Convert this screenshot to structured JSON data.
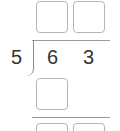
{
  "problem": {
    "type": "long-division",
    "divisor": "5",
    "dividend_digits": [
      "6",
      "3"
    ]
  },
  "quotient_boxes": [
    {
      "value": ""
    },
    {
      "value": ""
    }
  ],
  "step1_boxes": [
    {
      "value": ""
    }
  ],
  "step2_boxes": [
    {
      "value": ""
    },
    {
      "value": ""
    }
  ],
  "colors": {
    "text": "#333333",
    "box_border": "#b5b5b5",
    "line": "#9a9a9a"
  }
}
